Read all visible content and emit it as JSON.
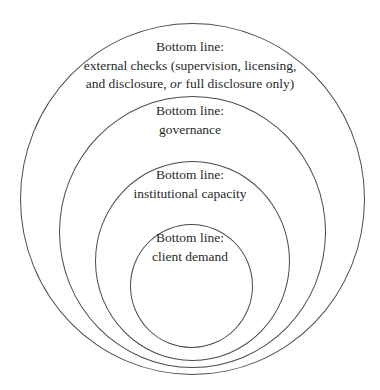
{
  "diagram": {
    "type": "nested-circles",
    "circles": [
      {
        "id": "outer",
        "title": "Bottom line:",
        "line2": "external checks (supervision, licensing,",
        "line3_pre": "and disclosure, ",
        "line3_em": "or",
        "line3_post": " full disclosure only)"
      },
      {
        "id": "second",
        "title": "Bottom line:",
        "line2": "governance"
      },
      {
        "id": "third",
        "title": "Bottom line:",
        "line2": "institutional capacity"
      },
      {
        "id": "inner",
        "title": "Bottom line:",
        "line2": "client demand"
      }
    ],
    "stroke_color": "#4a4a4a",
    "text_color": "#2a2a2a"
  }
}
